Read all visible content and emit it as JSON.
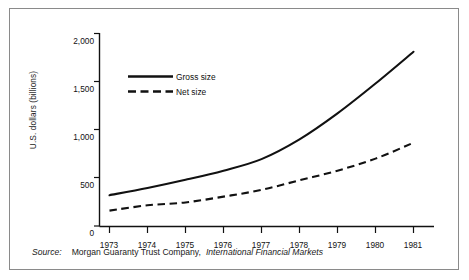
{
  "chart_data": {
    "type": "line",
    "title": "",
    "xlabel": "",
    "ylabel": "U.S. dollars (billions)",
    "x": [
      1973,
      1974,
      1975,
      1976,
      1977,
      1978,
      1979,
      1980,
      1981
    ],
    "xlim": [
      1972.6,
      1981.4
    ],
    "ylim": [
      0,
      2000
    ],
    "yticks": [
      0,
      500,
      1000,
      1500,
      2000
    ],
    "ytick_labels": [
      "0",
      "500",
      "1,000",
      "1,500",
      "2,000"
    ],
    "xtick_labels": [
      "1973",
      "1974",
      "1975",
      "1976",
      "1977",
      "1978",
      "1979",
      "1980",
      "1981"
    ],
    "grid": false,
    "legend_position": "upper-left-inside",
    "series": [
      {
        "name": "Gross size",
        "style": "solid",
        "color": "#111111",
        "values": [
          320,
          395,
          480,
          575,
          695,
          900,
          1170,
          1480,
          1810
        ]
      },
      {
        "name": "Net size",
        "style": "dashed",
        "color": "#111111",
        "values": [
          160,
          215,
          245,
          305,
          375,
          475,
          575,
          700,
          865
        ]
      }
    ]
  },
  "legend": {
    "items": [
      {
        "label": "Gross size",
        "style": "solid"
      },
      {
        "label": "Net size",
        "style": "dashed"
      }
    ]
  },
  "source": {
    "prefix": "Source:",
    "publisher": "Morgan Guaranty Trust Company,",
    "publication": "International Financial Markets"
  }
}
